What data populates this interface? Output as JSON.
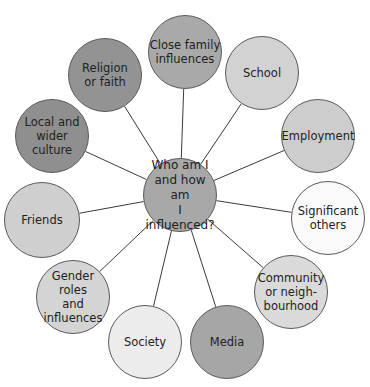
{
  "diagram": {
    "center": {
      "label": "Who am I\nand how am\nI influenced?",
      "x": 180,
      "y": 195,
      "r": 37,
      "color": "#a8a8a8"
    },
    "nodes": [
      {
        "label": "Close family\ninfluences",
        "x": 185,
        "y": 52,
        "r": 37,
        "color": "#a9a9a9"
      },
      {
        "label": "School",
        "x": 262,
        "y": 73,
        "r": 37,
        "color": "#d2d2d2"
      },
      {
        "label": "Employment",
        "x": 318,
        "y": 136,
        "r": 37,
        "color": "#cdcdcd"
      },
      {
        "label": "Significant\nothers",
        "x": 328,
        "y": 218,
        "r": 37,
        "color": "#fafafa"
      },
      {
        "label": "Community\nor neigh-\nbourhood",
        "x": 291,
        "y": 292,
        "r": 37,
        "color": "#dadada"
      },
      {
        "label": "Media",
        "x": 227,
        "y": 342,
        "r": 37,
        "color": "#a6a6a6"
      },
      {
        "label": "Society",
        "x": 145,
        "y": 342,
        "r": 37,
        "color": "#ececec"
      },
      {
        "label": "Gender roles\nand\ninfluences",
        "x": 73,
        "y": 297,
        "r": 37,
        "color": "#d4d4d4"
      },
      {
        "label": "Friends",
        "x": 42,
        "y": 220,
        "r": 38,
        "color": "#cfcfcf"
      },
      {
        "label": "Local and\nwider culture",
        "x": 52,
        "y": 136,
        "r": 37,
        "color": "#8f8f8f"
      },
      {
        "label": "Religion\nor faith",
        "x": 105,
        "y": 75,
        "r": 37,
        "color": "#939393"
      }
    ]
  }
}
